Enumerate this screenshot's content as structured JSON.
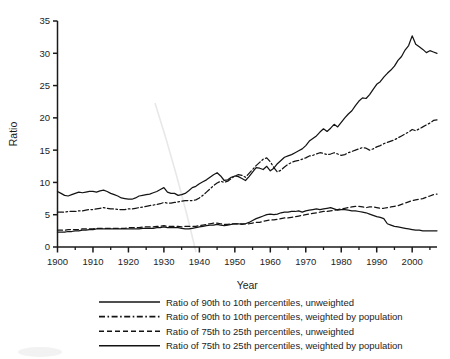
{
  "chart_data": {
    "type": "line",
    "title": "",
    "xlabel": "Year",
    "ylabel": "Ratio",
    "xlim": [
      1900,
      2007
    ],
    "ylim": [
      0,
      35
    ],
    "grid": false,
    "legend_position": "below",
    "x_ticks": [
      1900,
      1910,
      1920,
      1930,
      1940,
      1950,
      1960,
      1970,
      1980,
      1990,
      2000
    ],
    "x_tick_labels": [
      "1900",
      "1910",
      "1920",
      "1930",
      "1940",
      "1950",
      "1960",
      "1970",
      "1980",
      "1990",
      "2000"
    ],
    "x_minor_ticks": [
      1905,
      1915,
      1925,
      1935,
      1945,
      1955,
      1965,
      1975,
      1985,
      1995,
      2005
    ],
    "y_ticks": [
      0,
      5,
      10,
      15,
      20,
      25,
      30,
      35
    ],
    "y_tick_labels": [
      "0",
      "5",
      "10",
      "15",
      "20",
      "25",
      "30",
      "35"
    ],
    "x": [
      1900,
      1901,
      1902,
      1903,
      1904,
      1905,
      1906,
      1907,
      1908,
      1909,
      1910,
      1911,
      1912,
      1913,
      1914,
      1915,
      1916,
      1917,
      1918,
      1919,
      1920,
      1921,
      1922,
      1923,
      1924,
      1925,
      1926,
      1927,
      1928,
      1929,
      1930,
      1931,
      1932,
      1933,
      1934,
      1935,
      1936,
      1937,
      1938,
      1939,
      1940,
      1941,
      1942,
      1943,
      1944,
      1945,
      1946,
      1947,
      1948,
      1949,
      1950,
      1951,
      1952,
      1953,
      1954,
      1955,
      1956,
      1957,
      1958,
      1959,
      1960,
      1961,
      1962,
      1963,
      1964,
      1965,
      1966,
      1967,
      1968,
      1969,
      1970,
      1971,
      1972,
      1973,
      1974,
      1975,
      1976,
      1977,
      1978,
      1979,
      1980,
      1981,
      1982,
      1983,
      1984,
      1985,
      1986,
      1987,
      1988,
      1989,
      1990,
      1991,
      1992,
      1993,
      1994,
      1995,
      1996,
      1997,
      1998,
      1999,
      2000,
      2001,
      2002,
      2003,
      2004,
      2005,
      2006,
      2007
    ],
    "series": [
      {
        "name": "Ratio of 90th to 10th percentiles, unweighted",
        "style": "solid",
        "color": "#141414",
        "values": [
          8.6,
          8.3,
          8.0,
          7.9,
          8.1,
          8.3,
          8.5,
          8.4,
          8.5,
          8.6,
          8.6,
          8.5,
          8.7,
          8.8,
          8.6,
          8.3,
          8.1,
          7.9,
          7.6,
          7.5,
          7.4,
          7.4,
          7.6,
          7.9,
          8.0,
          8.1,
          8.2,
          8.4,
          8.6,
          8.9,
          9.2,
          8.5,
          8.3,
          8.3,
          8.0,
          8.1,
          8.3,
          8.7,
          9.2,
          9.4,
          9.8,
          10.1,
          10.4,
          10.8,
          11.2,
          11.5,
          11.0,
          10.3,
          10.4,
          10.8,
          11.0,
          10.9,
          10.6,
          10.3,
          10.9,
          11.6,
          12.3,
          12.2,
          12.0,
          12.5,
          11.8,
          12.2,
          12.9,
          13.4,
          13.9,
          14.1,
          14.3,
          14.6,
          14.9,
          15.2,
          15.7,
          16.4,
          16.8,
          17.2,
          17.8,
          18.3,
          17.9,
          18.4,
          19.0,
          18.6,
          19.3,
          20.0,
          20.6,
          21.1,
          21.9,
          22.6,
          23.1,
          23.0,
          23.6,
          24.4,
          25.2,
          25.6,
          26.3,
          26.9,
          27.4,
          28.0,
          28.9,
          29.5,
          30.5,
          31.2,
          32.7,
          31.4,
          31.0,
          30.6,
          30.1,
          30.4,
          30.2,
          30.0
        ]
      },
      {
        "name": "Ratio of 90th to 10th percentiles, weighted by population",
        "style": "dashdot",
        "color": "#141414",
        "values": [
          5.4,
          5.4,
          5.4,
          5.5,
          5.5,
          5.5,
          5.6,
          5.6,
          5.7,
          5.8,
          5.8,
          5.9,
          6.0,
          6.1,
          6.0,
          5.9,
          5.9,
          5.8,
          5.8,
          5.8,
          5.9,
          5.9,
          6.0,
          6.1,
          6.2,
          6.3,
          6.4,
          6.5,
          6.6,
          6.7,
          6.9,
          6.8,
          6.8,
          6.9,
          7.0,
          7.1,
          7.2,
          7.2,
          7.2,
          7.3,
          7.6,
          8.0,
          8.5,
          9.0,
          9.5,
          9.9,
          10.2,
          10.0,
          10.2,
          10.6,
          11.0,
          11.2,
          11.1,
          10.8,
          11.4,
          12.0,
          12.6,
          13.1,
          13.6,
          13.8,
          13.2,
          12.3,
          11.6,
          11.9,
          12.4,
          12.8,
          13.1,
          13.3,
          13.4,
          13.6,
          13.8,
          14.1,
          14.2,
          14.4,
          14.6,
          14.5,
          14.3,
          14.4,
          14.6,
          14.4,
          14.2,
          14.3,
          14.6,
          14.8,
          15.0,
          15.2,
          15.4,
          15.3,
          15.0,
          15.2,
          15.5,
          15.7,
          16.0,
          16.2,
          16.4,
          16.6,
          16.9,
          17.2,
          17.5,
          17.8,
          18.2,
          18.0,
          18.3,
          18.6,
          18.9,
          19.2,
          19.6,
          19.7
        ]
      },
      {
        "name": "Ratio of 75th to 25th percentiles, unweighted",
        "style": "dashed",
        "color": "#141414",
        "values": [
          2.6,
          2.6,
          2.6,
          2.7,
          2.7,
          2.7,
          2.7,
          2.8,
          2.8,
          2.8,
          2.8,
          2.9,
          2.9,
          2.9,
          2.9,
          2.9,
          2.9,
          2.9,
          2.9,
          2.9,
          3.0,
          3.0,
          3.0,
          3.0,
          3.1,
          3.1,
          3.1,
          3.1,
          3.2,
          3.2,
          3.3,
          3.2,
          3.2,
          3.2,
          3.2,
          3.1,
          3.2,
          3.2,
          3.2,
          3.2,
          3.3,
          3.4,
          3.5,
          3.6,
          3.7,
          3.7,
          3.6,
          3.5,
          3.5,
          3.6,
          3.6,
          3.6,
          3.6,
          3.6,
          3.6,
          3.7,
          3.8,
          3.8,
          4.0,
          4.1,
          4.2,
          4.2,
          4.3,
          4.4,
          4.5,
          4.5,
          4.6,
          4.7,
          4.8,
          4.9,
          5.0,
          5.1,
          5.2,
          5.3,
          5.4,
          5.5,
          5.5,
          5.6,
          5.7,
          5.8,
          5.9,
          6.0,
          6.1,
          6.2,
          6.3,
          6.3,
          6.2,
          6.1,
          6.2,
          6.2,
          6.1,
          6.0,
          6.0,
          6.1,
          6.2,
          6.3,
          6.4,
          6.6,
          6.8,
          7.0,
          7.2,
          7.3,
          7.4,
          7.5,
          7.7,
          7.9,
          8.1,
          8.2
        ]
      },
      {
        "name": "Ratio of 75th to 25th percentiles, weighted by population",
        "style": "solid",
        "color": "#141414",
        "values": [
          2.3,
          2.3,
          2.3,
          2.4,
          2.4,
          2.5,
          2.5,
          2.6,
          2.6,
          2.7,
          2.7,
          2.8,
          2.8,
          2.8,
          2.8,
          2.8,
          2.8,
          2.8,
          2.8,
          2.8,
          2.8,
          2.8,
          2.8,
          2.8,
          2.9,
          2.9,
          2.9,
          2.9,
          3.0,
          3.0,
          3.1,
          3.0,
          3.0,
          3.0,
          3.0,
          2.9,
          2.8,
          2.8,
          2.9,
          3.0,
          3.1,
          3.2,
          3.3,
          3.4,
          3.4,
          3.5,
          3.4,
          3.3,
          3.4,
          3.5,
          3.6,
          3.6,
          3.5,
          3.6,
          3.8,
          4.1,
          4.4,
          4.6,
          4.8,
          5.0,
          5.1,
          5.0,
          5.1,
          5.3,
          5.4,
          5.4,
          5.5,
          5.5,
          5.6,
          5.4,
          5.6,
          5.7,
          5.8,
          5.9,
          5.8,
          5.9,
          6.0,
          6.1,
          5.9,
          5.7,
          5.8,
          5.8,
          5.7,
          5.6,
          5.6,
          5.5,
          5.4,
          5.3,
          5.1,
          4.9,
          4.7,
          4.6,
          4.4,
          3.6,
          3.4,
          3.2,
          3.1,
          3.0,
          2.9,
          2.8,
          2.7,
          2.6,
          2.6,
          2.5,
          2.5,
          2.5,
          2.5,
          2.5
        ]
      }
    ]
  },
  "axis": {
    "y_title": "Ratio",
    "x_title": "Year"
  },
  "legend": {
    "entries": [
      {
        "label": "Ratio of 90th to 10th percentiles, unweighted",
        "style": "solid"
      },
      {
        "label": "Ratio of 90th to 10th percentiles, weighted by population",
        "style": "dashdot"
      },
      {
        "label": "Ratio of 75th to 25th percentiles, unweighted",
        "style": "dashed"
      },
      {
        "label": "Ratio of 75th to 25th percentiles, weighted by population",
        "style": "solid"
      }
    ]
  },
  "colors": {
    "ink": "#141414",
    "background": "#ffffff",
    "artifact": "#e8e8e8"
  }
}
